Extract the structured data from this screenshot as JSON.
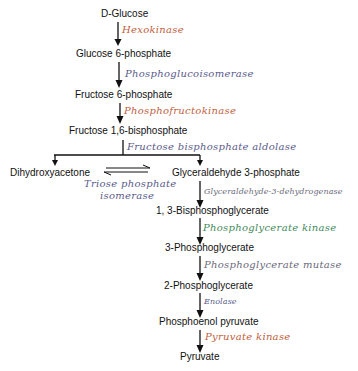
{
  "diagram": {
    "type": "metabolic-pathway",
    "name": "Glycolysis",
    "colors": {
      "metabolite": "#111111",
      "enzyme_orange": "#c0603c",
      "enzyme_purple": "#5a5a8a",
      "enzyme_green": "#3f8a5c",
      "enzyme_gray": "#6a6a7a",
      "arrow": "#111111"
    },
    "metabolites": {
      "d_glucose": "D-Glucose",
      "glucose_6_phosphate": "Glucose 6-phosphate",
      "fructose_6_phosphate": "Fructose 6-phosphate",
      "fructose_1_6_bisphosphate": "Fructose 1,6-bisphosphate",
      "dihydroxyacetone": "Dihydroxyacetone",
      "glyceraldehyde_3_phosphate": "Glyceraldehyde 3-phosphate",
      "bisphosphoglycerate_1_3": "1, 3-Bisphosphoglycerate",
      "phosphoglycerate_3": "3-Phosphoglycerate",
      "phosphoglycerate_2": "2-Phosphoglycerate",
      "phosphoenol_pyruvate": "Phosphoenol pyruvate",
      "pyruvate": "Pyruvate"
    },
    "enzymes": {
      "hexokinase": "Hexokinase",
      "phosphoglucoisomerase": "Phosphoglucoisomerase",
      "phosphofructokinase": "Phosphofructokinase",
      "aldolase": "Fructose bisphosphate aldolase",
      "triose_line1": "Triose phosphate",
      "triose_line2": "isomerase",
      "g3p_dehydrogenase": "Glyceraldehyde-3-dehydrogenase",
      "phosphoglycerate_kinase": "Phosphoglycerate kinase",
      "phosphoglycerate_mutase": "Phosphoglycerate mutase",
      "enolase": "Enolase",
      "pyruvate_kinase": "Pyruvate kinase"
    },
    "steps": [
      {
        "from": "D-Glucose",
        "to": "Glucose 6-phosphate",
        "enzyme": "Hexokinase"
      },
      {
        "from": "Glucose 6-phosphate",
        "to": "Fructose 6-phosphate",
        "enzyme": "Phosphoglucoisomerase"
      },
      {
        "from": "Fructose 6-phosphate",
        "to": "Fructose 1,6-bisphosphate",
        "enzyme": "Phosphofructokinase"
      },
      {
        "from": "Fructose 1,6-bisphosphate",
        "to": [
          "Dihydroxyacetone",
          "Glyceraldehyde 3-phosphate"
        ],
        "enzyme": "Fructose bisphosphate aldolase"
      },
      {
        "from": "Dihydroxyacetone",
        "to": "Glyceraldehyde 3-phosphate",
        "enzyme": "Triose phosphate isomerase",
        "reversible": true
      },
      {
        "from": "Glyceraldehyde 3-phosphate",
        "to": "1, 3-Bisphosphoglycerate",
        "enzyme": "Glyceraldehyde-3-dehydrogenase"
      },
      {
        "from": "1, 3-Bisphosphoglycerate",
        "to": "3-Phosphoglycerate",
        "enzyme": "Phosphoglycerate kinase"
      },
      {
        "from": "3-Phosphoglycerate",
        "to": "2-Phosphoglycerate",
        "enzyme": "Phosphoglycerate mutase"
      },
      {
        "from": "2-Phosphoglycerate",
        "to": "Phosphoenol pyruvate",
        "enzyme": "Enolase"
      },
      {
        "from": "Phosphoenol pyruvate",
        "to": "Pyruvate",
        "enzyme": "Pyruvate kinase"
      }
    ]
  }
}
